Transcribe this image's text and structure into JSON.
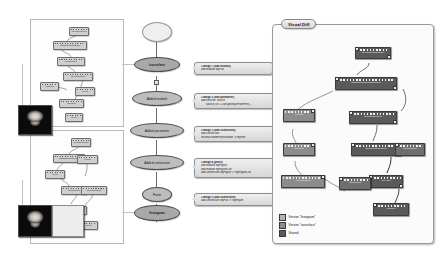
{
  "app": {
    "title": "Visual Diff",
    "domain": "provenance-version-tree"
  },
  "version_tree": {
    "nodes": [
      {
        "label": "",
        "state": "root"
      },
      {
        "label": "isosurface",
        "state": "selected"
      },
      {
        "label": "Added module",
        "state": "normal"
      },
      {
        "label": "Added parameter",
        "state": "normal"
      },
      {
        "label": "Added connection",
        "state": "normal"
      },
      {
        "label": "Paste",
        "state": "normal"
      },
      {
        "label": "histogram",
        "state": "selected"
      }
    ]
  },
  "changes": [
    {
      "header": "Change 1 (add module)",
      "lines": [
        "add module MyPlot"
      ]
    },
    {
      "header": "Change 2 (add parameter)",
      "lines": [
        "add function 'source'",
        "source('src' = self.getInputFromPort(..."
      ]
    },
    {
      "header": "Change 3 (add connection)",
      "lines": [
        "add connection",
        "vtkStructuredPointsReader -> MyPlot"
      ]
    },
    {
      "header": "Change 4 (paste)",
      "lines": [
        "add module MyFigure",
        "add module MyFigureCell",
        "add connection MyFigure -> MyFigureCell"
      ]
    },
    {
      "header": "Change 5 (add connection)",
      "lines": [
        "add connection MyPlot -> MyFigure"
      ]
    }
  ],
  "visual_diff": {
    "title": "Visual Diff",
    "legend": [
      {
        "label": "Version \"histogram\"",
        "swatch": "hist"
      },
      {
        "label": "Version \"isosurface\"",
        "swatch": "iso"
      },
      {
        "label": "Shared",
        "swatch": "shared"
      }
    ],
    "modules": [
      {
        "name": "vtkVolume16Reader",
        "group": "shared"
      },
      {
        "name": "vtkStructuredPointsReader",
        "group": "shared"
      },
      {
        "name": "vtkContourFilter",
        "group": "shared"
      },
      {
        "name": "vtkPolyDataMapper",
        "group": "shared"
      },
      {
        "name": "vtkActor",
        "group": "shared"
      },
      {
        "name": "vtkRenderer",
        "group": "shared"
      },
      {
        "name": "MyPlot",
        "group": "hist"
      },
      {
        "name": "MyFigure",
        "group": "hist"
      },
      {
        "name": "MyFigureCell",
        "group": "hist"
      },
      {
        "name": "vtkCamera",
        "group": "iso"
      },
      {
        "name": "VTKCell",
        "group": "iso"
      }
    ]
  },
  "workflow_top": {
    "modules": [
      "vtkVolume16Reader",
      "vtkStructuredPointsReader",
      "vtkContourFilter",
      "vtkPolyDataMapper",
      "vtkActor",
      "vtkCamera",
      "vtkRenderer",
      "VTKCell"
    ]
  },
  "workflow_bottom": {
    "modules": [
      "vtkVolume16Reader",
      "vtkStructuredPointsReader",
      "MyPlot",
      "MyFigure",
      "vtkContourFilter",
      "vtkPolyDataMapper",
      "MyFigureCell",
      "VTKCell"
    ]
  },
  "thumbnails": [
    {
      "name": "isosurface-preview"
    },
    {
      "name": "histogram-preview"
    }
  ]
}
